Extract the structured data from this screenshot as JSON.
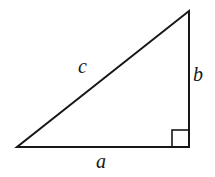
{
  "figure": {
    "name": "right-triangle-pythagorean-diagram",
    "background_color": "#ffffff",
    "stroke_color": "#171717",
    "stroke_width": 2,
    "vertices": {
      "bottom_left": {
        "x": 17,
        "y": 147
      },
      "bottom_right": {
        "x": 189,
        "y": 147
      },
      "top_right": {
        "x": 189,
        "y": 11
      }
    },
    "right_angle_marker": {
      "name": "right-angle-square",
      "x": 172,
      "y": 130,
      "size": 17,
      "at_vertex": "bottom_right"
    },
    "labels": {
      "hypotenuse": "c",
      "vertical_leg": "b",
      "horizontal_leg": "a"
    }
  },
  "chart_data": {
    "type": "diagram",
    "title": "",
    "subtitle": "",
    "shape": "right triangle",
    "segments": [
      {
        "name": "horizontal-leg",
        "label": "a",
        "from": "bottom_left",
        "to": "bottom_right",
        "length_px": 172
      },
      {
        "name": "vertical-leg",
        "label": "b",
        "from": "bottom_right",
        "to": "top_right",
        "length_px": 136
      },
      {
        "name": "hypotenuse",
        "label": "c",
        "from": "bottom_left",
        "to": "top_right",
        "length_px": 219
      }
    ],
    "annotations": [
      "right angle at bottom-right vertex"
    ],
    "legend": [],
    "grid": false
  }
}
